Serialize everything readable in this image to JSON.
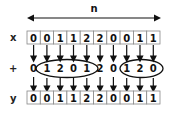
{
  "diagram": {
    "length_label": "n",
    "rows": {
      "x": {
        "label": "x",
        "values": [
          "0",
          "0",
          "1",
          "1",
          "2",
          "2",
          "0",
          "0",
          "1",
          "1"
        ]
      },
      "plus": {
        "label": "+",
        "values": [
          "0",
          "1",
          "2",
          "0",
          "1",
          "2",
          "0",
          "1",
          "2",
          "0"
        ]
      },
      "y": {
        "label": "y",
        "values": [
          "0",
          "0",
          "1",
          "1",
          "2",
          "2",
          "0",
          "0",
          "1",
          "1"
        ]
      }
    },
    "groups": [
      {
        "start_index": 1,
        "end_index": 4,
        "values": [
          "1",
          "2",
          "0",
          "1"
        ]
      },
      {
        "start_index": 7,
        "end_index": 9,
        "values": [
          "1",
          "2",
          "0"
        ]
      }
    ],
    "colors": {
      "stroke": "#111111",
      "cell_border": "#888888",
      "background": "#ffffff"
    }
  }
}
